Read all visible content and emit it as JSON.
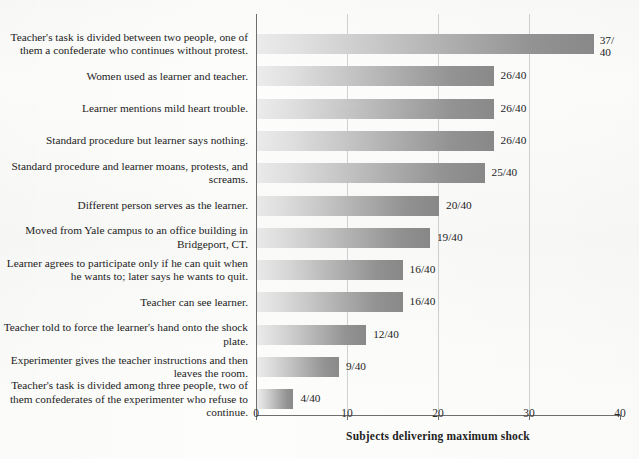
{
  "chart_data": {
    "type": "bar",
    "orientation": "horizontal",
    "title": "",
    "xlabel": "Subjects delivering maximum shock",
    "ylabel": "",
    "xlim": [
      0,
      40
    ],
    "xticks": [
      "0",
      "10",
      "20",
      "30",
      "40"
    ],
    "gridlines": [
      10,
      20,
      30
    ],
    "grid": true,
    "legend": null,
    "denominator": 40,
    "categories": [
      "Teacher's task is divided between two people, one of them a confederate who continues without protest.",
      "Women used as learner and teacher.",
      "Learner mentions mild heart trouble.",
      "Standard procedure but learner says nothing.",
      "Standard procedure and learner moans, protests, and screams.",
      "Different person serves as the learner.",
      "Moved from Yale campus to an office building in Bridgeport, CT.",
      "Learner agrees to participate only if he can quit when he wants to; later says he wants to quit.",
      "Teacher can see learner.",
      "Teacher told to force the learner's hand onto the shock plate.",
      "Experimenter gives the teacher instructions and then leaves the room.",
      "Teacher's task is divided among three people, two of them confederates of the experimenter who refuse to continue."
    ],
    "values": [
      37,
      26,
      26,
      26,
      25,
      20,
      19,
      16,
      16,
      12,
      9,
      4
    ],
    "value_labels": [
      "37/\n40",
      "26/40",
      "26/40",
      "26/40",
      "25/40",
      "20/40",
      "19/40",
      "16/40",
      "16/40",
      "12/40",
      "9/40",
      "4/40"
    ],
    "bar_gradient": {
      "start": "#ececec",
      "end": "#8a8a8a"
    },
    "axis_color": "#6f6f6f",
    "grid_color": "#d2d2d2",
    "background": "#fdfdfc"
  }
}
